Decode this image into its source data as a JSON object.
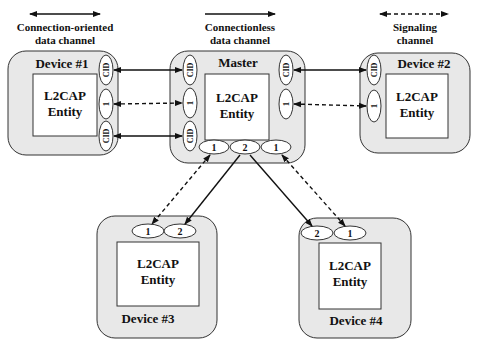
{
  "legend": {
    "connection_oriented": [
      "Connection-oriented",
      "data channel"
    ],
    "connectionless": [
      "Connectionless",
      "data channel"
    ],
    "signaling": [
      "Signaling",
      "channel"
    ]
  },
  "nodes": {
    "device1": {
      "title": "Device #1",
      "entity": [
        "L2CAP",
        "Entity"
      ],
      "cid_label": "CID",
      "sig_label": "1"
    },
    "master": {
      "title": "Master",
      "entity": [
        "L2CAP",
        "Entity"
      ],
      "cid_label": "CID",
      "sig_label": "1",
      "bottom_ports": [
        "1",
        "2",
        "1"
      ]
    },
    "device2": {
      "title": "Device #2",
      "entity": [
        "L2CAP",
        "Entity"
      ],
      "cid_label": "CID",
      "sig_label": "1"
    },
    "device3": {
      "title": "Device #3",
      "entity": [
        "L2CAP",
        "Entity"
      ],
      "ports": [
        "1",
        "2"
      ]
    },
    "device4": {
      "title": "Device #4",
      "entity": [
        "L2CAP",
        "Entity"
      ],
      "ports": [
        "2",
        "1"
      ]
    }
  },
  "colors": {
    "box_fill": "#e8e8e8",
    "stroke": "#333333",
    "entity_fill": "#ffffff"
  }
}
